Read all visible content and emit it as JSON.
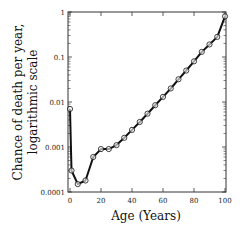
{
  "chart_data": {
    "type": "line",
    "title": "",
    "xlabel": "Age (Years)",
    "ylabel_lines": [
      "Chance of death per year,",
      "logarithmic scale"
    ],
    "ylabel": "Chance of death per year, logarithmic scale",
    "yscale": "log",
    "xlim": [
      0,
      100
    ],
    "ylim": [
      0.0001,
      1
    ],
    "x_ticks": [
      0,
      20,
      40,
      60,
      80,
      100
    ],
    "x_tick_labels": [
      "0",
      "20",
      "40",
      "60",
      "80",
      "100"
    ],
    "y_ticks": [
      0.0001,
      0.001,
      0.01,
      0.1,
      1
    ],
    "y_tick_labels": [
      "0.0001",
      "0.001",
      "0.01",
      "0.1",
      "1"
    ],
    "grid": false,
    "legend": null,
    "series": [
      {
        "name": "mortality",
        "marker": "open-circle",
        "x": [
          0,
          1,
          5,
          10,
          15,
          20,
          25,
          30,
          35,
          40,
          45,
          50,
          55,
          60,
          65,
          70,
          75,
          80,
          85,
          90,
          95,
          100
        ],
        "values": [
          0.007,
          0.0003,
          0.00015,
          0.00018,
          0.0006,
          0.0009,
          0.0009,
          0.0011,
          0.0016,
          0.0024,
          0.0036,
          0.0055,
          0.0085,
          0.013,
          0.02,
          0.032,
          0.05,
          0.08,
          0.13,
          0.19,
          0.28,
          0.8
        ]
      }
    ]
  },
  "colors": {
    "line": "#111111",
    "marker_fill": "#ffffff",
    "axis": "#333333"
  }
}
